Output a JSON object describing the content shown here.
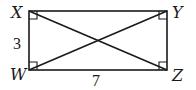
{
  "diagram": {
    "type": "rectangle-with-diagonals",
    "vertices": [
      {
        "id": "X",
        "label": "X",
        "position": "top-left"
      },
      {
        "id": "Y",
        "label": "Y",
        "position": "top-right"
      },
      {
        "id": "W",
        "label": "W",
        "position": "bottom-left"
      },
      {
        "id": "Z",
        "label": "Z",
        "position": "bottom-right"
      }
    ],
    "sides": [
      {
        "from": "X",
        "to": "W",
        "label": "3"
      },
      {
        "from": "W",
        "to": "Z",
        "label": "7"
      }
    ],
    "diagonals": [
      {
        "from": "X",
        "to": "Z"
      },
      {
        "from": "W",
        "to": "Y"
      }
    ],
    "right_angle_markers": [
      "X",
      "Y",
      "W",
      "Z"
    ],
    "colors": {
      "stroke": "#1a1a1a",
      "background": "#ffffff"
    }
  }
}
